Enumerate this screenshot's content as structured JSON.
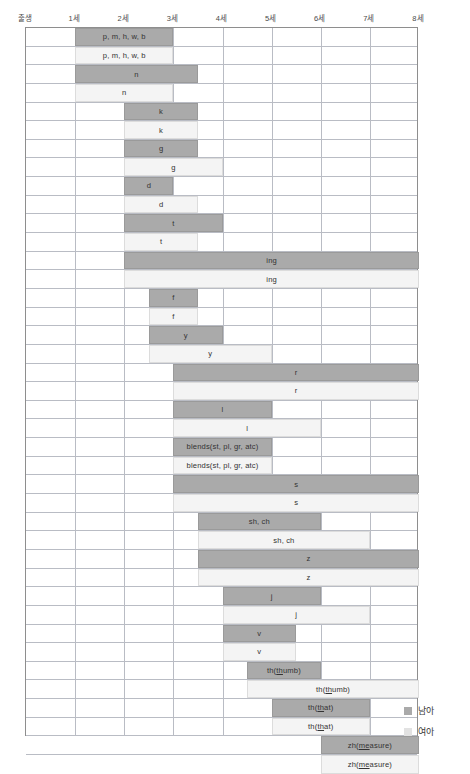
{
  "legend": {
    "items": [
      {
        "label": "남아",
        "color": "#aaaaaa",
        "key": "male"
      },
      {
        "label": "여아",
        "color": "#e2e2e2",
        "key": "female"
      }
    ]
  },
  "chart_data": {
    "type": "bar",
    "orientation": "horizontal",
    "title": "",
    "xlabel": "",
    "ylabel": "",
    "grid": true,
    "legend_position": "right-bottom",
    "xlim": [
      0,
      8
    ],
    "x_unit": "세",
    "xticks": [
      0,
      1,
      2,
      3,
      4,
      5,
      6,
      7,
      8
    ],
    "xticklabels": [
      "출생",
      "1세",
      "2세",
      "3세",
      "4세",
      "5세",
      "6세",
      "7세",
      "8세"
    ],
    "series": [
      {
        "name": "남아",
        "color": "#aaaaaa"
      },
      {
        "name": "여아",
        "color": "#f4f4f4"
      }
    ],
    "bars": [
      {
        "label": "p, m, h, w, b",
        "series": "남아",
        "start": 1.0,
        "end": 3.0
      },
      {
        "label": "p, m, h, w, b",
        "series": "여아",
        "start": 1.0,
        "end": 3.0
      },
      {
        "label": "n",
        "series": "남아",
        "start": 1.0,
        "end": 3.5
      },
      {
        "label": "n",
        "series": "여아",
        "start": 1.0,
        "end": 3.0
      },
      {
        "label": "k",
        "series": "남아",
        "start": 2.0,
        "end": 3.5
      },
      {
        "label": "k",
        "series": "여아",
        "start": 2.0,
        "end": 3.5
      },
      {
        "label": "g",
        "series": "남아",
        "start": 2.0,
        "end": 3.5
      },
      {
        "label": "g",
        "series": "여아",
        "start": 2.0,
        "end": 4.0
      },
      {
        "label": "d",
        "series": "남아",
        "start": 2.0,
        "end": 3.0
      },
      {
        "label": "d",
        "series": "여아",
        "start": 2.0,
        "end": 3.5
      },
      {
        "label": "t",
        "series": "남아",
        "start": 2.0,
        "end": 4.0
      },
      {
        "label": "t",
        "series": "여아",
        "start": 2.0,
        "end": 3.5
      },
      {
        "label": "ing",
        "series": "남아",
        "start": 2.0,
        "end": 8.0
      },
      {
        "label": "ing",
        "series": "여아",
        "start": 2.0,
        "end": 8.0
      },
      {
        "label": "f",
        "series": "남아",
        "start": 2.5,
        "end": 3.5
      },
      {
        "label": "f",
        "series": "여아",
        "start": 2.5,
        "end": 3.5
      },
      {
        "label": "y",
        "series": "남아",
        "start": 2.5,
        "end": 4.0
      },
      {
        "label": "y",
        "series": "여아",
        "start": 2.5,
        "end": 5.0
      },
      {
        "label": "r",
        "series": "남아",
        "start": 3.0,
        "end": 8.0
      },
      {
        "label": "r",
        "series": "여아",
        "start": 3.0,
        "end": 8.0
      },
      {
        "label": "l",
        "series": "남아",
        "start": 3.0,
        "end": 5.0
      },
      {
        "label": "l",
        "series": "여아",
        "start": 3.0,
        "end": 6.0
      },
      {
        "label": "blends(st, pl, gr, atc)",
        "series": "남아",
        "start": 3.0,
        "end": 5.0
      },
      {
        "label": "blends(st, pl, gr, atc)",
        "series": "여아",
        "start": 3.0,
        "end": 5.0
      },
      {
        "label": "s",
        "series": "남아",
        "start": 3.0,
        "end": 8.0
      },
      {
        "label": "s",
        "series": "여아",
        "start": 3.0,
        "end": 8.0
      },
      {
        "label": "sh, ch",
        "series": "남아",
        "start": 3.5,
        "end": 6.0
      },
      {
        "label": "sh, ch",
        "series": "여아",
        "start": 3.5,
        "end": 7.0
      },
      {
        "label": "z",
        "series": "남아",
        "start": 3.5,
        "end": 8.0
      },
      {
        "label": "z",
        "series": "여아",
        "start": 3.5,
        "end": 8.0
      },
      {
        "label": "j",
        "series": "남아",
        "start": 4.0,
        "end": 6.0
      },
      {
        "label": "j",
        "series": "여아",
        "start": 4.0,
        "end": 7.0
      },
      {
        "label": "v",
        "series": "남아",
        "start": 4.0,
        "end": 5.5
      },
      {
        "label": "v",
        "series": "여아",
        "start": 4.0,
        "end": 5.5
      },
      {
        "label": "th(thumb)",
        "series": "남아",
        "start": 4.5,
        "end": 6.0
      },
      {
        "label": "th(thumb)",
        "series": "여아",
        "start": 4.5,
        "end": 8.0
      },
      {
        "label": "th(that)",
        "series": "남아",
        "start": 5.0,
        "end": 7.0
      },
      {
        "label": "th(that)",
        "series": "여아",
        "start": 5.0,
        "end": 7.0
      },
      {
        "label": "zh(measure)",
        "series": "남아",
        "start": 6.0,
        "end": 8.0
      },
      {
        "label": "zh(measure)",
        "series": "여아",
        "start": 6.0,
        "end": 8.0
      }
    ]
  }
}
